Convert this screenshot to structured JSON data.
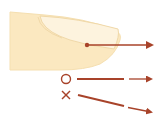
{
  "diagram": {
    "colors": {
      "background": "#ffffff",
      "skin": "#fbe8c0",
      "skin_edge": "#f2d9a8",
      "nail": "#fdf3de",
      "nail_edge": "#f0d8a8",
      "arrow": "#a8432a"
    },
    "main_gesture": {
      "icon": "touch-point-icon",
      "direction": "right"
    },
    "examples": [
      {
        "mark": "○",
        "meaning": "correct",
        "path": "straight-horizontal"
      },
      {
        "mark": "×",
        "meaning": "incorrect",
        "path": "diagonal-down"
      }
    ]
  }
}
